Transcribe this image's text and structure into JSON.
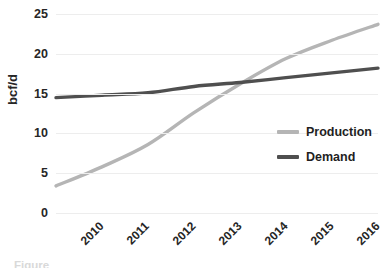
{
  "chart_data": {
    "type": "line",
    "title": "",
    "subtitle": "",
    "xlabel": "",
    "ylabel": "bcf/d",
    "x": [
      "2010",
      "2011",
      "2012",
      "2013",
      "2014",
      "2015",
      "2016",
      "2017"
    ],
    "categories": [
      "2010",
      "2011",
      "2012",
      "2013",
      "2014",
      "2015",
      "2016",
      "2017"
    ],
    "xlim": [
      2010,
      2017
    ],
    "ylim": [
      0,
      25
    ],
    "yticks": [
      0,
      5,
      10,
      15,
      20,
      25
    ],
    "ytick_labels": [
      "0",
      "5",
      "10",
      "15",
      "20",
      "25"
    ],
    "grid": "horizontal",
    "legend_position": "center-right",
    "series": [
      {
        "name": "Production",
        "color": "#b5b5b5",
        "values": [
          3.4,
          5.8,
          8.6,
          12.6,
          16.2,
          19.4,
          21.7,
          23.7
        ]
      },
      {
        "name": "Demand",
        "color": "#4f4f4f",
        "values": [
          14.5,
          14.8,
          15.1,
          15.9,
          16.4,
          17.0,
          17.6,
          18.2
        ]
      }
    ],
    "annotations": [
      "Production curve crosses Demand curve at approximately 2014.5 at about 16.5 bcf/d"
    ]
  },
  "axes": {
    "y_title": "bcf/d",
    "y_tick_labels": [
      "25",
      "20",
      "15",
      "10",
      "5",
      "0"
    ],
    "x_tick_labels": [
      "2010",
      "2011",
      "2012",
      "2013",
      "2014",
      "2015",
      "2016",
      "2017"
    ]
  },
  "legend": {
    "items": [
      {
        "label": "Production",
        "color": "#b5b5b5"
      },
      {
        "label": "Demand",
        "color": "#4f4f4f"
      }
    ]
  },
  "caption": {
    "text": "Figure"
  },
  "colors": {
    "production": "#b5b5b5",
    "demand": "#4f4f4f",
    "gridline": "#ededed",
    "text": "#262626",
    "background": "#ffffff"
  }
}
